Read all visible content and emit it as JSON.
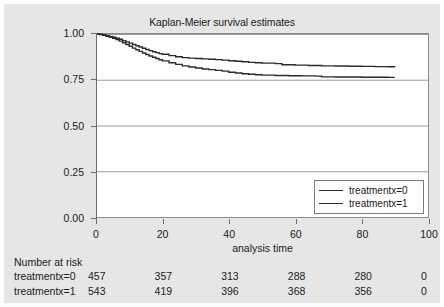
{
  "chart_data": {
    "type": "line",
    "title": "Kaplan-Meier survival estimates",
    "xlabel": "analysis time",
    "ylabel": "",
    "xlim": [
      0,
      100
    ],
    "ylim": [
      0.0,
      1.0
    ],
    "grid": true,
    "legend_position": "lower-right",
    "xticks": [
      0,
      20,
      40,
      60,
      80,
      100
    ],
    "xtick_labels": [
      "0",
      "20",
      "40",
      "60",
      "80",
      "100"
    ],
    "yticks": [
      0.0,
      0.25,
      0.5,
      0.75,
      1.0
    ],
    "ytick_labels": [
      "0.00",
      "0.25",
      "0.50",
      "0.75",
      "1.00"
    ],
    "series": [
      {
        "name": "treatmentx=1",
        "legend_label": "treatmentx=1",
        "color": "#2b2b2b",
        "points": [
          [
            0,
            1.0
          ],
          [
            1,
            0.998
          ],
          [
            2,
            0.995
          ],
          [
            3,
            0.991
          ],
          [
            4,
            0.987
          ],
          [
            5,
            0.982
          ],
          [
            6,
            0.977
          ],
          [
            7,
            0.971
          ],
          [
            8,
            0.964
          ],
          [
            9,
            0.957
          ],
          [
            10,
            0.95
          ],
          [
            11,
            0.943
          ],
          [
            12,
            0.936
          ],
          [
            13,
            0.929
          ],
          [
            14,
            0.922
          ],
          [
            15,
            0.915
          ],
          [
            16,
            0.909
          ],
          [
            17,
            0.903
          ],
          [
            18,
            0.898
          ],
          [
            19,
            0.893
          ],
          [
            20,
            0.889
          ],
          [
            22,
            0.882
          ],
          [
            24,
            0.876
          ],
          [
            26,
            0.871
          ],
          [
            28,
            0.868
          ],
          [
            30,
            0.866
          ],
          [
            32,
            0.864
          ],
          [
            34,
            0.862
          ],
          [
            36,
            0.86
          ],
          [
            38,
            0.857
          ],
          [
            40,
            0.854
          ],
          [
            42,
            0.851
          ],
          [
            44,
            0.848
          ],
          [
            46,
            0.845
          ],
          [
            48,
            0.843
          ],
          [
            50,
            0.841
          ],
          [
            54,
            0.838
          ],
          [
            56,
            0.832
          ],
          [
            60,
            0.83
          ],
          [
            64,
            0.828
          ],
          [
            68,
            0.826
          ],
          [
            72,
            0.825
          ],
          [
            76,
            0.824
          ],
          [
            80,
            0.823
          ],
          [
            84,
            0.822
          ],
          [
            88,
            0.821
          ],
          [
            90,
            0.82
          ]
        ]
      },
      {
        "name": "treatmentx=0",
        "legend_label": "treatmentx=0",
        "color": "#2b2b2b",
        "points": [
          [
            0,
            1.0
          ],
          [
            1,
            0.997
          ],
          [
            2,
            0.993
          ],
          [
            3,
            0.988
          ],
          [
            4,
            0.982
          ],
          [
            5,
            0.976
          ],
          [
            6,
            0.969
          ],
          [
            7,
            0.961
          ],
          [
            8,
            0.952
          ],
          [
            9,
            0.943
          ],
          [
            10,
            0.933
          ],
          [
            11,
            0.923
          ],
          [
            12,
            0.914
          ],
          [
            13,
            0.905
          ],
          [
            14,
            0.896
          ],
          [
            15,
            0.888
          ],
          [
            16,
            0.88
          ],
          [
            17,
            0.873
          ],
          [
            18,
            0.866
          ],
          [
            19,
            0.859
          ],
          [
            20,
            0.853
          ],
          [
            22,
            0.843
          ],
          [
            24,
            0.834
          ],
          [
            26,
            0.826
          ],
          [
            28,
            0.82
          ],
          [
            30,
            0.814
          ],
          [
            32,
            0.809
          ],
          [
            34,
            0.805
          ],
          [
            36,
            0.801
          ],
          [
            38,
            0.797
          ],
          [
            40,
            0.791
          ],
          [
            42,
            0.787
          ],
          [
            44,
            0.783
          ],
          [
            46,
            0.78
          ],
          [
            48,
            0.777
          ],
          [
            50,
            0.775
          ],
          [
            54,
            0.773
          ],
          [
            58,
            0.772
          ],
          [
            62,
            0.771
          ],
          [
            66,
            0.77
          ],
          [
            68,
            0.766
          ],
          [
            72,
            0.765
          ],
          [
            76,
            0.765
          ],
          [
            80,
            0.764
          ],
          [
            84,
            0.764
          ],
          [
            88,
            0.763
          ],
          [
            90,
            0.763
          ]
        ]
      }
    ]
  },
  "risk_table": {
    "title": "Number at risk",
    "times": [
      0,
      20,
      40,
      60,
      80,
      100
    ],
    "rows": [
      {
        "label": "treatmentx=0",
        "values": [
          "457",
          "357",
          "313",
          "288",
          "280",
          "0"
        ]
      },
      {
        "label": "treatmentx=1",
        "values": [
          "543",
          "419",
          "396",
          "368",
          "356",
          "0"
        ]
      }
    ]
  },
  "colors": {
    "background": "#e6e6e6",
    "plot_background": "#ffffff",
    "line": "#2b2b2b",
    "grid": "#9a9a9a",
    "axis": "#6f6f6f",
    "text": "#1a1a1a"
  }
}
